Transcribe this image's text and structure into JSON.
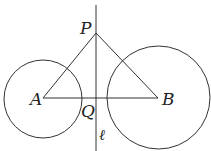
{
  "diagram": {
    "type": "geometry",
    "labels": {
      "P": "P",
      "A": "A",
      "B": "B",
      "Q": "Q",
      "line": "ℓ"
    },
    "points": {
      "P": [
        96,
        33
      ],
      "A": [
        43,
        98
      ],
      "B": [
        158,
        98
      ],
      "Q": [
        96,
        98
      ]
    },
    "circles": [
      {
        "name": "circle-A",
        "center": [
          43,
          99
        ],
        "r": 39
      },
      {
        "name": "circle-B",
        "center": [
          158.5,
          97.5
        ],
        "r": 51.5
      }
    ],
    "line_l": {
      "x": 96,
      "y1": 5,
      "y2": 151
    },
    "stroke_color": "#333333"
  }
}
